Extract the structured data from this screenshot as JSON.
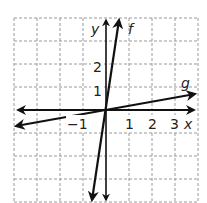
{
  "graph": {
    "x_axis_label": "x",
    "y_axis_label": "y",
    "x_ticks": [
      "−1",
      "1",
      "2",
      "3"
    ],
    "y_ticks": [
      "1",
      "2"
    ],
    "grid": {
      "style": "dashed",
      "color": "#9a9a9a",
      "xmin": -4,
      "xmax": 4,
      "ymin": -4,
      "ymax": 4
    },
    "lines": [
      {
        "name": "f",
        "label": "f",
        "equation_estimate": "y = 7x",
        "color": "#111111"
      },
      {
        "name": "g",
        "label": "g",
        "equation_estimate": "y = 0.2x",
        "color": "#111111"
      }
    ]
  }
}
